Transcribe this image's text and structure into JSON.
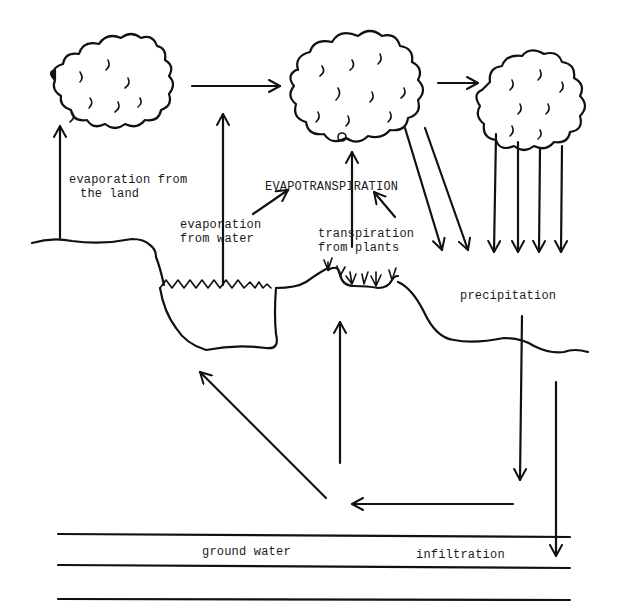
{
  "diagram": {
    "colors": {
      "ink": "#111111",
      "background": "#ffffff"
    },
    "labels": {
      "evap_land_line1": "evaporation from",
      "evap_land_line2": "the land",
      "evap_water_line1": "evaporation",
      "evap_water_line2": "from water",
      "evapotranspiration": "EVAPOTRANSPIRATION",
      "transpiration_line1": "transpiration",
      "transpiration_line2": "from plants",
      "precipitation": "precipitation",
      "ground_water": "ground water",
      "infiltration": "infiltration"
    },
    "elements": {
      "clouds": [
        "cloud-left",
        "cloud-center",
        "cloud-right"
      ],
      "layers": [
        "land-surface",
        "lake",
        "plants",
        "ground-water-band"
      ]
    }
  }
}
